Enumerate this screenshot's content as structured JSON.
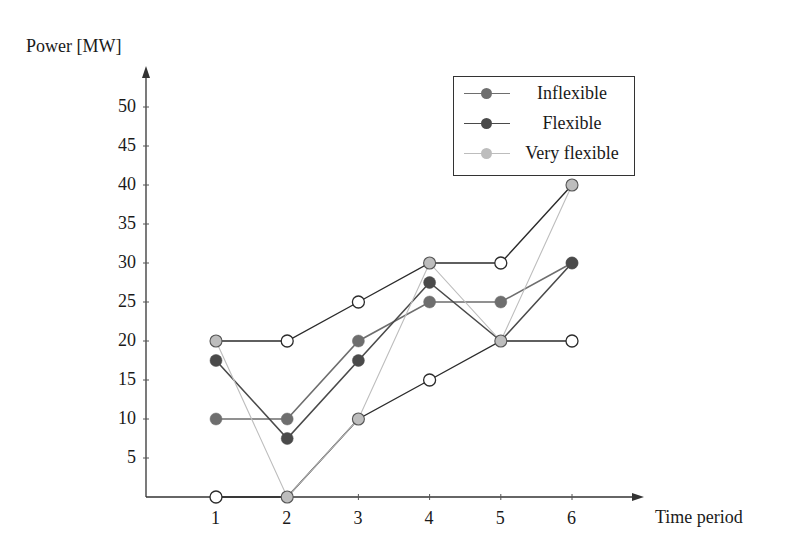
{
  "chart_data": {
    "type": "line",
    "title": "",
    "xlabel": "Time period",
    "ylabel": "Power [MW]",
    "x": [
      1,
      2,
      3,
      4,
      5,
      6
    ],
    "xticks": [
      "1",
      "2",
      "3",
      "4",
      "5",
      "6"
    ],
    "yticks": [
      "5",
      "10",
      "15",
      "20",
      "25",
      "30",
      "35",
      "40",
      "45",
      "50"
    ],
    "ylim": [
      0,
      50
    ],
    "grid": false,
    "legend_position": "upper right",
    "series": [
      {
        "name": "Inflexible",
        "color": "#6e6e6e",
        "values": [
          10,
          10,
          20,
          25,
          25,
          30
        ]
      },
      {
        "name": "Flexible",
        "color": "#4a4a4a",
        "values": [
          17.5,
          7.5,
          17.5,
          27.5,
          20,
          30
        ]
      },
      {
        "name": "Very flexible",
        "color": "#bdbdbd",
        "values": [
          20,
          0,
          10,
          30,
          20,
          40
        ]
      },
      {
        "name": "Upper bound",
        "color": "#2b2b2b",
        "values": [
          20,
          20,
          25,
          30,
          30,
          40
        ],
        "in_legend": false,
        "marker": "open-circle"
      },
      {
        "name": "Lower bound",
        "color": "#2b2b2b",
        "values": [
          0,
          0,
          10,
          15,
          20,
          20
        ],
        "in_legend": false,
        "marker": "open-circle"
      }
    ]
  },
  "axes": {
    "ylabel": "Power [MW]",
    "xlabel": "Time period"
  },
  "legend": {
    "items": [
      {
        "label": "Inflexible",
        "color": "#6e6e6e"
      },
      {
        "label": "Flexible",
        "color": "#4a4a4a"
      },
      {
        "label": "Very flexible",
        "color": "#bdbdbd"
      }
    ]
  }
}
